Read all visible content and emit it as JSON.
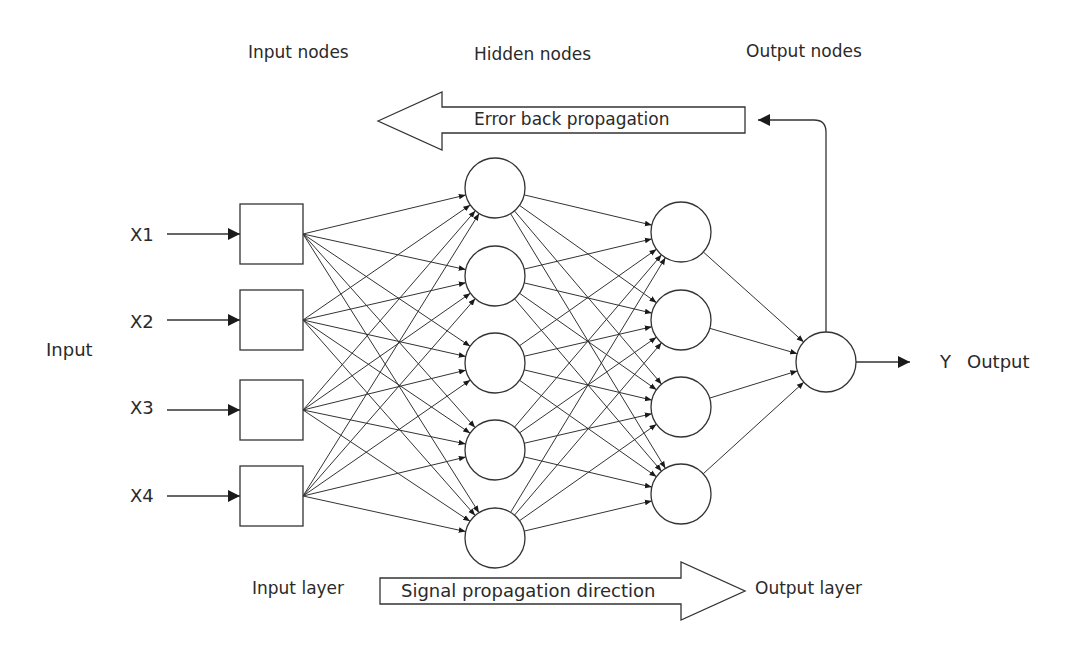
{
  "diagram": {
    "title_labels": {
      "input_nodes": "Input nodes",
      "hidden_nodes": "Hidden nodes",
      "output_nodes": "Output nodes"
    },
    "side_labels": {
      "input": "Input",
      "y": "Y",
      "output": "Output"
    },
    "arrows": {
      "error_back": "Error back propagation",
      "signal": "Signal propagation direction"
    },
    "layer_labels": {
      "input_layer": "Input layer",
      "output_layer": "Output layer"
    },
    "inputs": [
      "X1",
      "X2",
      "X3",
      "X4"
    ],
    "colors": {
      "stroke": "#333333",
      "text": "#2a2a2a",
      "background": "#ffffff"
    },
    "geometry": {
      "input_boxes": [
        {
          "x": 240,
          "y": 204,
          "w": 63,
          "h": 60
        },
        {
          "x": 240,
          "y": 290,
          "w": 63,
          "h": 60
        },
        {
          "x": 240,
          "y": 380,
          "w": 63,
          "h": 60
        },
        {
          "x": 240,
          "y": 466,
          "w": 63,
          "h": 60
        }
      ],
      "hidden_nodes": [
        {
          "cx": 495,
          "cy": 188
        },
        {
          "cx": 495,
          "cy": 276
        },
        {
          "cx": 495,
          "cy": 363
        },
        {
          "cx": 495,
          "cy": 450
        },
        {
          "cx": 495,
          "cy": 538
        }
      ],
      "output_nodes": [
        {
          "cx": 681,
          "cy": 232
        },
        {
          "cx": 681,
          "cy": 320
        },
        {
          "cx": 681,
          "cy": 407
        },
        {
          "cx": 681,
          "cy": 494
        }
      ],
      "final_node": {
        "cx": 826,
        "cy": 362
      },
      "radius": 30
    }
  }
}
